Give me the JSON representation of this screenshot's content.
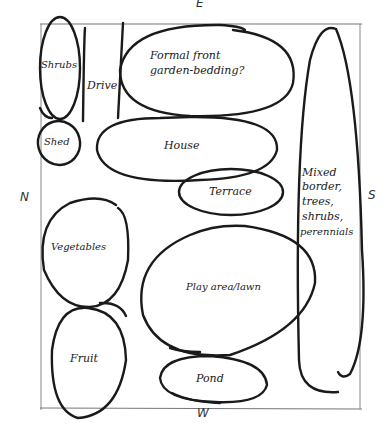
{
  "compass": {
    "top": "E",
    "bottom": "W",
    "left": "N",
    "right": "S"
  },
  "zones": {
    "shrubs": "Shrubs",
    "drive": "Drive",
    "formal_line1": "Formal front",
    "formal_line2": "garden-bedding?",
    "shed": "Shed",
    "house": "House",
    "terrace": "Terrace",
    "vegetables": "Vegetables",
    "play": "Play area/lawn",
    "fruit": "Fruit",
    "pond": "Pond",
    "border_lines": [
      "Mixed",
      "border,",
      "trees,",
      "shrubs,",
      "perennials"
    ]
  },
  "colors": {
    "ink": "#1a1a1a",
    "frame": "#888888",
    "paper": "#ffffff"
  }
}
